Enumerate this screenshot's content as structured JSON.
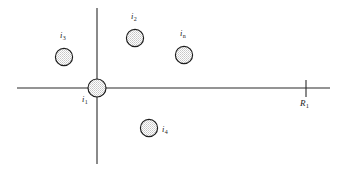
{
  "figure": {
    "title": "",
    "background_color": "#ffffff",
    "line_color": "#2a2a2a",
    "node_outline_color": "#1c1c1c",
    "node_fill_color": "#d8d8d8",
    "width": 340,
    "height": 174
  },
  "axes": {
    "horizontal": {
      "name": "horizontal-axis",
      "x1": 17,
      "y1": 88,
      "x2": 330,
      "y2": 88
    },
    "vertical": {
      "name": "vertical-axis",
      "x1": 97,
      "y1": 8,
      "x2": 97,
      "y2": 164
    },
    "tick": {
      "name": "axis-tick",
      "x": 306,
      "y1": 80,
      "y2": 97,
      "label_base": "R",
      "label_sub": "1",
      "label_x": 300,
      "label_y": 99
    }
  },
  "nodes": [
    {
      "id": "i1",
      "label_base": "i",
      "label_sub": "1",
      "cx": 97,
      "cy": 88,
      "r": 9,
      "label_x": 82,
      "label_y": 95
    },
    {
      "id": "i2",
      "label_base": "i",
      "label_sub": "2",
      "cx": 135,
      "cy": 38,
      "r": 8.6,
      "label_x": 131,
      "label_y": 12
    },
    {
      "id": "i3",
      "label_base": "i",
      "label_sub": "3",
      "cx": 64,
      "cy": 57,
      "r": 8.6,
      "label_x": 60,
      "label_y": 31
    },
    {
      "id": "in",
      "label_base": "i",
      "label_sub": "n",
      "cx": 184,
      "cy": 55,
      "r": 8.6,
      "label_x": 180,
      "label_y": 29
    },
    {
      "id": "i4",
      "label_base": "i",
      "label_sub": "4",
      "cx": 149,
      "cy": 128,
      "r": 8.6,
      "label_x": 162,
      "label_y": 125
    }
  ]
}
